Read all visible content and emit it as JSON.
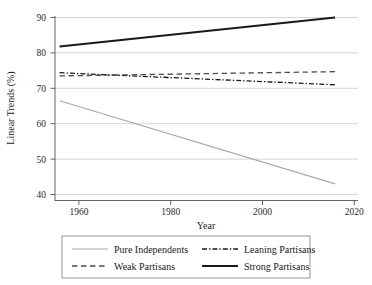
{
  "chart_data": {
    "type": "line",
    "title": "",
    "xlabel": "Year",
    "ylabel": "Linear Trends (%)",
    "xlim": [
      1955,
      2021
    ],
    "ylim": [
      38,
      91
    ],
    "xticks": [
      1960,
      1980,
      2000,
      2020
    ],
    "yticks": [
      40,
      50,
      60,
      70,
      80,
      90
    ],
    "xtick_labels": [
      "1960",
      "1980",
      "2000",
      "2020"
    ],
    "ytick_labels": [
      "40",
      "50",
      "60",
      "70",
      "80",
      "90"
    ],
    "grid": "horizontal",
    "legend_position": "below",
    "x": [
      1956,
      2016
    ],
    "series": [
      {
        "name": "Pure Independents",
        "values": [
          66.5,
          43.0
        ],
        "color": "#a8a8a8",
        "dash": "none",
        "width": 1.1
      },
      {
        "name": "Leaning Partisans",
        "values": [
          74.4,
          71.0
        ],
        "color": "#1a1a1a",
        "dash": "dashdot",
        "width": 1.3
      },
      {
        "name": "Weak Partisans",
        "values": [
          73.5,
          74.7
        ],
        "color": "#4d4d4d",
        "dash": "dashed",
        "width": 1.3
      },
      {
        "name": "Strong Partisans",
        "values": [
          81.8,
          90.0
        ],
        "color": "#1a1a1a",
        "dash": "none",
        "width": 2.0
      }
    ]
  },
  "axes": {
    "y_title": "Linear Trends (%)",
    "x_title": "Year",
    "y_labels": [
      "90",
      "80",
      "70",
      "60",
      "50",
      "40"
    ],
    "x_labels": [
      "1960",
      "1980",
      "2000",
      "2020"
    ]
  },
  "legend": {
    "entries": [
      {
        "label": "Pure Independents",
        "style": "solid-light"
      },
      {
        "label": "Leaning Partisans",
        "style": "dashdot-dark"
      },
      {
        "label": "Weak Partisans",
        "style": "dashed-gray"
      },
      {
        "label": "Strong Partisans",
        "style": "solid-thick-dark"
      }
    ]
  },
  "colors": {
    "gridline": "#c9c9c9",
    "axis": "#555555",
    "text": "#1a1a1a",
    "pure_independents": "#a8a8a8",
    "weak_partisans": "#4d4d4d",
    "leaning_partisans": "#1a1a1a",
    "strong_partisans": "#1a1a1a",
    "legend_border": "#8a8a8a",
    "background": "#ffffff"
  }
}
